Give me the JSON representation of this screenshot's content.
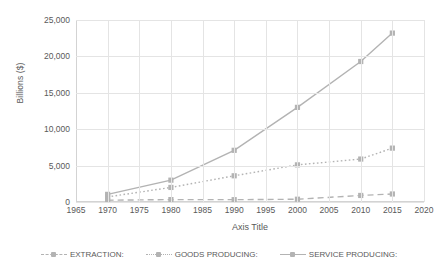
{
  "chart_data": {
    "type": "line",
    "title": "",
    "xlabel": "Axis Title",
    "ylabel": "Billions ($)",
    "x": [
      1970,
      1980,
      1990,
      2000,
      2010,
      2015
    ],
    "xlim": [
      1965,
      2020
    ],
    "ylim": [
      0,
      25000
    ],
    "xticks": [
      "1965",
      "1970",
      "1975",
      "1980",
      "1985",
      "1990",
      "1995",
      "2000",
      "2005",
      "2010",
      "2015",
      "2020"
    ],
    "yticks": [
      "0",
      "5,000",
      "10,000",
      "15,000",
      "20,000",
      "25,000"
    ],
    "ytick_values": [
      0,
      5000,
      10000,
      15000,
      20000,
      25000
    ],
    "grid": "both",
    "legend_position": "bottom",
    "series": [
      {
        "name": "EXTRACTION:",
        "style": "dashed",
        "color": "#b3b3b3",
        "marker": "square",
        "values": [
          250,
          330,
          320,
          380,
          900,
          1100
        ]
      },
      {
        "name": "GOODS PRODUCING:",
        "style": "dotted",
        "color": "#b3b3b3",
        "marker": "square",
        "values": [
          700,
          2000,
          3600,
          5100,
          5900,
          7400
        ]
      },
      {
        "name": "SERVICE PRODUCING:",
        "style": "solid",
        "color": "#b3b3b3",
        "marker": "square",
        "values": [
          1050,
          3000,
          7100,
          13000,
          19300,
          23200
        ]
      }
    ]
  },
  "axes": {
    "x_title": "Axis Title",
    "y_title": "Billions ($)"
  },
  "legend": {
    "items": [
      {
        "label": "EXTRACTION:"
      },
      {
        "label": "GOODS PRODUCING:"
      },
      {
        "label": "SERVICE PRODUCING:"
      }
    ]
  },
  "colors": {
    "series": "#b3b3b3",
    "gridline": "#e4e4e4",
    "axis": "#d3d3d3",
    "text": "#595959",
    "background": "#ffffff"
  }
}
